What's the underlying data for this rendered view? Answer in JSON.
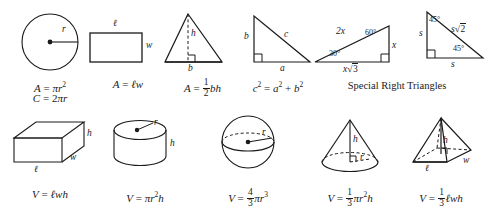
{
  "sheet": {
    "title": "Geometry Formula Reference",
    "stroke_color": "#1a1a1a",
    "background": "#ffffff",
    "caption_special": "Special Right Triangles"
  },
  "row1": [
    {
      "name": "circle",
      "labels": {
        "radius": "r"
      },
      "formula_line1": {
        "lhs": "A",
        "rhs_pi": "π",
        "rhs_var": "r",
        "rhs_exp": "2"
      },
      "formula_line2": {
        "lhs": "C",
        "coef": "2",
        "pi": "π",
        "var": "r"
      }
    },
    {
      "name": "rectangle",
      "labels": {
        "length": "ℓ",
        "width": "w"
      },
      "formula": {
        "lhs": "A",
        "rhs": "ℓw"
      }
    },
    {
      "name": "triangle",
      "labels": {
        "height": "h",
        "base": "b"
      },
      "formula": {
        "lhs": "A",
        "num": "1",
        "den": "2",
        "rhs": "bh"
      }
    },
    {
      "name": "right-triangle",
      "labels": {
        "leg_b": "b",
        "hyp_c": "c",
        "leg_a": "a"
      },
      "formula": {
        "lhs": "c",
        "lhs_exp": "2",
        "a": "a",
        "a_exp": "2",
        "b": "b",
        "b_exp": "2"
      }
    },
    {
      "name": "special-right-triangles",
      "triangle_30_60_90": {
        "hyp": "2x",
        "short_leg": "x",
        "long_leg_coef": "x",
        "long_leg_radicand": "3",
        "angle_small": "30°",
        "angle_large": "60°"
      },
      "triangle_45_45_90": {
        "leg_left": "s",
        "leg_bottom": "s",
        "hyp_coef": "s",
        "hyp_radicand": "2",
        "angle_top": "45°",
        "angle_bottom": "45°"
      },
      "caption": "Special Right Triangles"
    }
  ],
  "row2": [
    {
      "name": "rectangular-prism",
      "labels": {
        "height": "h",
        "width": "w",
        "length": "ℓ"
      },
      "formula": {
        "lhs": "V",
        "rhs": "ℓwh"
      }
    },
    {
      "name": "cylinder",
      "labels": {
        "radius": "r",
        "height": "h"
      },
      "formula": {
        "lhs": "V",
        "pi": "π",
        "var": "r",
        "exp": "2",
        "h": "h"
      }
    },
    {
      "name": "sphere",
      "labels": {
        "radius": "r"
      },
      "formula": {
        "lhs": "V",
        "num": "4",
        "den": "3",
        "pi": "π",
        "var": "r",
        "exp": "3"
      }
    },
    {
      "name": "cone",
      "labels": {
        "height": "h",
        "radius": "r"
      },
      "formula": {
        "lhs": "V",
        "num": "1",
        "den": "3",
        "pi": "π",
        "var": "r",
        "exp": "2",
        "h": "h"
      }
    },
    {
      "name": "pyramid",
      "labels": {
        "height": "h",
        "width": "w",
        "length": "ℓ"
      },
      "formula": {
        "lhs": "V",
        "num": "1",
        "den": "3",
        "rhs": "ℓwh"
      }
    }
  ],
  "symbols": {
    "equals": "=",
    "plus": "+",
    "radical": "√"
  }
}
